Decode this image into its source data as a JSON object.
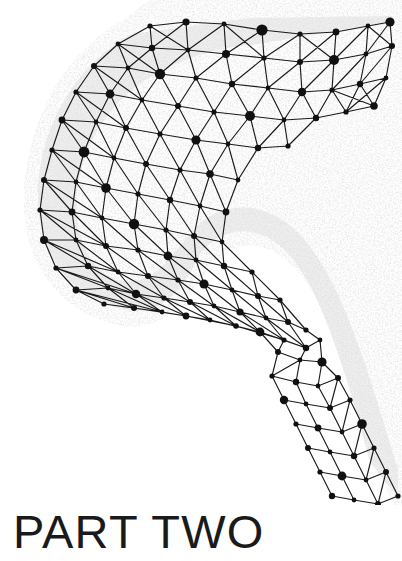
{
  "page": {
    "title": "PART TWO",
    "background_color": "#ffffff",
    "width": 402,
    "height": 561
  },
  "heading": {
    "text": "PART TWO",
    "color": "#1a1a1a"
  },
  "artwork": {
    "name": "network-mesh-chevron",
    "description": "Triangulated node-and-edge network forming a sideways chevron / C shape with a soft grey stipple halo",
    "node_color": "#111111",
    "edge_color": "#1a1a1a",
    "fill_color": "#efefef",
    "stipple_color": "#bdbdbd",
    "node_count": 168,
    "edge_width": 1.15
  }
}
